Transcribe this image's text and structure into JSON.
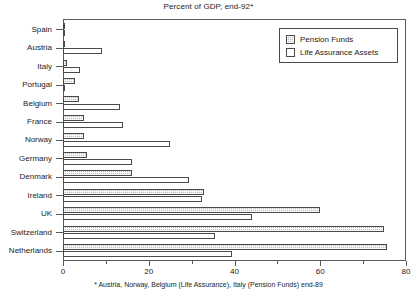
{
  "chart_data": {
    "type": "bar",
    "orientation": "horizontal",
    "title": "Percent of GDP, end-92*",
    "xlabel": "",
    "ylabel": "",
    "xlim": [
      0,
      80
    ],
    "xticks": [
      0,
      20,
      40,
      60,
      80
    ],
    "xtick_labels": [
      "0",
      "20",
      "40",
      "60",
      "80"
    ],
    "xticks_minor": [
      10,
      30,
      50,
      70
    ],
    "grid": false,
    "legend_position": "top-right",
    "categories": [
      "Spain",
      "Austria",
      "Italy",
      "Portugal",
      "Belgium",
      "France",
      "Norway",
      "Germany",
      "Denmark",
      "Ireland",
      "UK",
      "Switzerland",
      "Netherlands"
    ],
    "series": [
      {
        "name": "Pension Funds",
        "color": "#bdbdbd",
        "pattern": "hatched",
        "values": [
          0.3,
          0.4,
          1.0,
          2.7,
          3.8,
          4.8,
          5.0,
          5.5,
          16.0,
          33.0,
          60.0,
          74.8,
          75.5
        ]
      },
      {
        "name": "Life Assurance Assets",
        "color": "#ffffff",
        "pattern": "solid",
        "values": [
          0.3,
          9.0,
          4.0,
          0.3,
          13.2,
          14.0,
          25.0,
          16.0,
          29.5,
          32.5,
          44.0,
          35.5,
          39.5
        ]
      }
    ],
    "footnote": "* Austria, Norway, Belgium (Life Assurance), Italy (Pension Funds) end-89"
  },
  "legend": {
    "items": [
      {
        "label": "Pension Funds",
        "swatch": "hatched-gray-swatch"
      },
      {
        "label": "Life Assurance Assets",
        "swatch": "white-swatch"
      }
    ]
  }
}
